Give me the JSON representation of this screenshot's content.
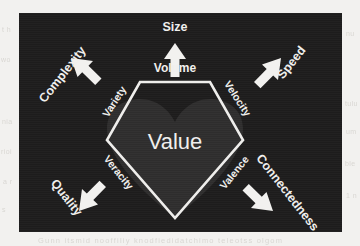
{
  "page": {
    "ghost_text": {
      "left": [
        "t h",
        "wo",
        "nia",
        "rioi",
        "a r",
        "s"
      ],
      "right": [
        "nu",
        "tulu",
        "um",
        "ble",
        "1 n"
      ],
      "bottom": "Gunn itsmid nooffiliy  knodfiedidatchimo  teleotss  olgom"
    }
  },
  "figure": {
    "core": {
      "label": "Value",
      "shape": "heart"
    },
    "hexagon": {
      "label_top": "Volume"
    },
    "dimensions": [
      {
        "id": "size",
        "inner": "Volume",
        "outer": "Size",
        "direction": "up"
      },
      {
        "id": "speed",
        "inner": "Velocity",
        "outer": "Speed",
        "direction": "up-right"
      },
      {
        "id": "connectedness",
        "inner": "Valence",
        "outer": "Connectedness",
        "direction": "down-right"
      },
      {
        "id": "quality",
        "inner": "Veracity",
        "outer": "Quality",
        "direction": "down-left"
      },
      {
        "id": "complexity",
        "inner": "Variety",
        "outer": "Complexity",
        "direction": "up-left"
      }
    ],
    "colors": {
      "panel_background": "#1d1c1c",
      "stroke": "#efeeec",
      "heart": "#2e2d2d",
      "page_background": "#f2f1ef"
    }
  }
}
